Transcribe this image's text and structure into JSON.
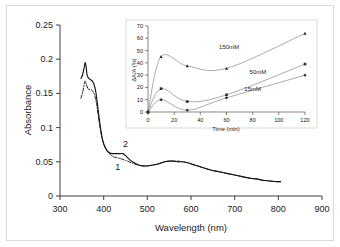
{
  "figure": {
    "background_color": "#ffffff",
    "border_color": "#d8d8d8"
  },
  "chart_data": [
    {
      "type": "line",
      "name": "main-uv-vis-spectra",
      "title": "",
      "xlabel": "Wavelength (nm)",
      "ylabel": "Absorbance",
      "xlim": [
        300,
        900
      ],
      "ylim": [
        0,
        0.25
      ],
      "xticks": [
        300,
        400,
        500,
        600,
        700,
        800,
        900
      ],
      "yticks": [
        0,
        0.05,
        0.1,
        0.15,
        0.2,
        0.25
      ],
      "xtick_labels": [
        "300",
        "400",
        "500",
        "600",
        "700",
        "800",
        "900"
      ],
      "ytick_labels": [
        "0",
        "0.05",
        "0.1",
        "0.15",
        "0.2",
        "0.25"
      ],
      "grid": false,
      "legend": "none",
      "annotations": [
        {
          "text": "1",
          "x": 432,
          "y": 0.038
        },
        {
          "text": "2",
          "x": 450,
          "y": 0.072
        }
      ],
      "series": [
        {
          "name": "2",
          "style": "solid",
          "x": [
            348,
            352,
            356,
            358,
            360,
            362,
            366,
            370,
            374,
            378,
            382,
            386,
            390,
            394,
            398,
            402,
            408,
            414,
            420,
            426,
            432,
            438,
            444,
            450,
            458,
            466,
            474,
            482,
            490,
            500,
            510,
            520,
            530,
            540,
            550,
            560,
            570,
            580,
            590,
            600,
            615,
            630,
            645,
            660,
            675,
            690,
            705,
            720,
            735,
            750,
            765,
            780,
            795,
            805
          ],
          "y": [
            0.172,
            0.178,
            0.19,
            0.195,
            0.188,
            0.177,
            0.172,
            0.17,
            0.168,
            0.163,
            0.152,
            0.133,
            0.112,
            0.094,
            0.081,
            0.073,
            0.066,
            0.063,
            0.062,
            0.062,
            0.062,
            0.062,
            0.062,
            0.059,
            0.054,
            0.05,
            0.047,
            0.045,
            0.044,
            0.044,
            0.045,
            0.046,
            0.048,
            0.05,
            0.051,
            0.051,
            0.05,
            0.05,
            0.049,
            0.047,
            0.044,
            0.041,
            0.038,
            0.036,
            0.034,
            0.032,
            0.03,
            0.028,
            0.026,
            0.025,
            0.023,
            0.022,
            0.021,
            0.021
          ]
        },
        {
          "name": "1",
          "style": "dash-dot",
          "x": [
            348,
            352,
            356,
            358,
            360,
            364,
            368,
            372,
            376,
            380,
            384,
            388,
            392,
            396,
            400,
            406,
            412,
            418,
            424,
            430,
            436,
            442,
            450,
            458,
            466,
            474,
            482,
            490,
            500,
            510,
            520,
            530,
            540,
            550,
            560,
            570,
            580,
            590,
            600,
            615,
            630,
            645,
            660,
            675,
            690,
            705,
            720,
            735,
            750,
            765,
            780,
            795,
            805
          ],
          "y": [
            0.143,
            0.152,
            0.165,
            0.168,
            0.163,
            0.157,
            0.156,
            0.155,
            0.152,
            0.146,
            0.134,
            0.116,
            0.099,
            0.085,
            0.076,
            0.068,
            0.063,
            0.059,
            0.057,
            0.056,
            0.055,
            0.054,
            0.052,
            0.05,
            0.048,
            0.046,
            0.045,
            0.044,
            0.044,
            0.045,
            0.046,
            0.048,
            0.05,
            0.051,
            0.051,
            0.051,
            0.05,
            0.049,
            0.047,
            0.044,
            0.041,
            0.038,
            0.036,
            0.034,
            0.032,
            0.03,
            0.028,
            0.026,
            0.025,
            0.023,
            0.022,
            0.021,
            0.021
          ]
        }
      ]
    },
    {
      "type": "line",
      "name": "inset-kinetics",
      "title": "",
      "xlabel": "Time (min)",
      "ylabel": "ΔA/A (%)",
      "xlim": [
        0,
        120
      ],
      "ylim": [
        0,
        70
      ],
      "xticks": [
        0,
        20,
        40,
        60,
        80,
        100,
        120
      ],
      "yticks": [
        0,
        10,
        20,
        30,
        40,
        50,
        60,
        70
      ],
      "xtick_labels": [
        "0",
        "20",
        "40",
        "60",
        "80",
        "100",
        "120"
      ],
      "ytick_labels": [
        "0",
        "10",
        "20",
        "30",
        "40",
        "50",
        "60",
        "70"
      ],
      "grid": false,
      "legend": "inline-labels",
      "series": [
        {
          "name": "150mM",
          "label": "150mM",
          "label_x": 62,
          "label_y": 51,
          "marker": "triangle",
          "x": [
            0,
            10,
            30,
            60,
            120
          ],
          "y": [
            0,
            45,
            37.5,
            35.5,
            64
          ]
        },
        {
          "name": "50mM",
          "label": "50mM",
          "label_x": 84,
          "label_y": 31,
          "marker": "square",
          "x": [
            0,
            10,
            30,
            60,
            120
          ],
          "y": [
            0,
            19,
            8.5,
            14,
            39
          ]
        },
        {
          "name": "15mM",
          "label": "15mM",
          "label_x": 80,
          "label_y": 17,
          "marker": "diamond",
          "x": [
            0,
            10,
            30,
            60,
            120
          ],
          "y": [
            0,
            10,
            1.5,
            11.5,
            30
          ]
        }
      ]
    }
  ]
}
